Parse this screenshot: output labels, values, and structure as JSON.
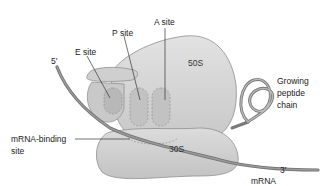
{
  "diagram": {
    "labels": {
      "a_site": "A site",
      "p_site": "P site",
      "e_site": "E site",
      "five_prime": "5′",
      "three_prime": "3′",
      "large_subunit": "50S",
      "small_subunit": "30S",
      "growing_peptide_line1": "Growing",
      "growing_peptide_line2": "peptide",
      "growing_peptide_line3": "chain",
      "mrna_binding_line1": "mRNA-binding",
      "mrna_binding_line2": "site",
      "mrna": "mRNA"
    },
    "colors": {
      "subunit_fill": "#d6d6d6",
      "subunit_stroke": "#8a8a8a",
      "site_fill": "#bdbdbd",
      "mrna_strand": "#7a7a7a",
      "leader_line": "#333333",
      "text": "#222222"
    }
  }
}
